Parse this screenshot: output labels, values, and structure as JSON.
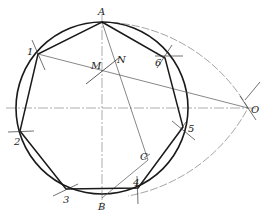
{
  "diagram": {
    "points": {
      "A": "A",
      "B": "B",
      "C": "C",
      "M": "M",
      "N": "N",
      "O": "O",
      "v1": "1",
      "v2": "2",
      "v3": "3",
      "v4": "4",
      "v5": "5",
      "v6": "6"
    },
    "colors": {
      "stroke_heavy": "#1a1a1a",
      "stroke_thin": "#555555",
      "background": "#ffffff"
    }
  }
}
